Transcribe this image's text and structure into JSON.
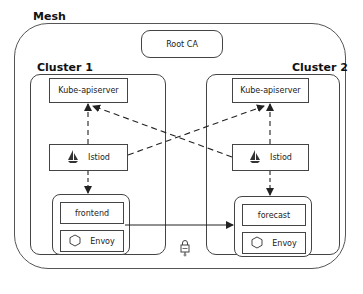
{
  "diagram": {
    "mesh": {
      "label": "Mesh"
    },
    "root_ca": {
      "label": "Root CA"
    },
    "clusters": [
      {
        "label": "Cluster 1",
        "apiserver": "Kube-apiserver",
        "istiod": {
          "label": "Istiod",
          "icon": "sailboat-icon"
        },
        "pod": {
          "service": "frontend",
          "sidecar": {
            "label": "Envoy",
            "icon": "hexagon-icon"
          }
        }
      },
      {
        "label": "Cluster 2",
        "apiserver": "Kube-apiserver",
        "istiod": {
          "label": "Istiod",
          "icon": "sailboat-icon"
        },
        "pod": {
          "service": "forecast",
          "sidecar": {
            "label": "Envoy",
            "icon": "hexagon-icon"
          }
        }
      }
    ],
    "connections": [
      {
        "from": "Cluster 1 Istiod",
        "to": "Cluster 1 Kube-apiserver",
        "style": "dashed"
      },
      {
        "from": "Cluster 1 Istiod",
        "to": "Cluster 2 Kube-apiserver",
        "style": "dashed"
      },
      {
        "from": "Cluster 2 Istiod",
        "to": "Cluster 1 Kube-apiserver",
        "style": "dashed"
      },
      {
        "from": "Cluster 2 Istiod",
        "to": "Cluster 2 Kube-apiserver",
        "style": "dashed"
      },
      {
        "from": "Cluster 1 Istiod",
        "to": "frontend pod",
        "style": "dashed"
      },
      {
        "from": "Cluster 2 Istiod",
        "to": "forecast pod",
        "style": "dashed"
      },
      {
        "from": "frontend",
        "to": "forecast pod",
        "style": "solid",
        "secured": "lock-icon"
      }
    ],
    "colors": {
      "line": "#444444",
      "background": "#ffffff",
      "text": "#222222"
    }
  }
}
